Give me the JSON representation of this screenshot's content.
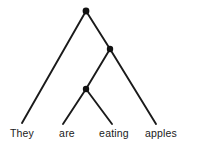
{
  "diagram": {
    "kind": "syntax-tree",
    "background_color": "#ffffff",
    "line_color": "#1a1a1a",
    "node_color": "#111111",
    "text_color": "#1a1a1a",
    "sentence": "They are eating apples",
    "nodes": [
      {
        "id": "n1",
        "x": 86,
        "y": 11,
        "r": 3.4
      },
      {
        "id": "n2",
        "x": 110,
        "y": 49,
        "r": 3.2
      },
      {
        "id": "n3",
        "x": 86,
        "y": 89,
        "r": 3.2
      }
    ],
    "edges": [
      {
        "id": "e1",
        "from": "n1",
        "to": "leaf-they",
        "x1": 86,
        "y1": 11,
        "x2": 22,
        "y2": 123
      },
      {
        "id": "e2",
        "from": "n1",
        "to": "n2",
        "x1": 86,
        "y1": 11,
        "x2": 110,
        "y2": 49
      },
      {
        "id": "e3",
        "from": "n2",
        "to": "n3",
        "x1": 110,
        "y1": 49,
        "x2": 86,
        "y2": 89
      },
      {
        "id": "e4",
        "from": "n2",
        "to": "leaf-apples",
        "x1": 110,
        "y1": 49,
        "x2": 156,
        "y2": 124
      },
      {
        "id": "e5",
        "from": "n3",
        "to": "leaf-are",
        "x1": 86,
        "y1": 89,
        "x2": 63,
        "y2": 124
      },
      {
        "id": "e6",
        "from": "n3",
        "to": "leaf-eating",
        "x1": 86,
        "y1": 89,
        "x2": 112,
        "y2": 124
      }
    ],
    "leaves": [
      {
        "id": "leaf-they",
        "label": "They",
        "x": 22,
        "y": 127
      },
      {
        "id": "leaf-are",
        "label": "are",
        "x": 67,
        "y": 127
      },
      {
        "id": "leaf-eating",
        "label": "eating",
        "x": 114,
        "y": 127
      },
      {
        "id": "leaf-apples",
        "label": "apples",
        "x": 161,
        "y": 127
      }
    ]
  }
}
